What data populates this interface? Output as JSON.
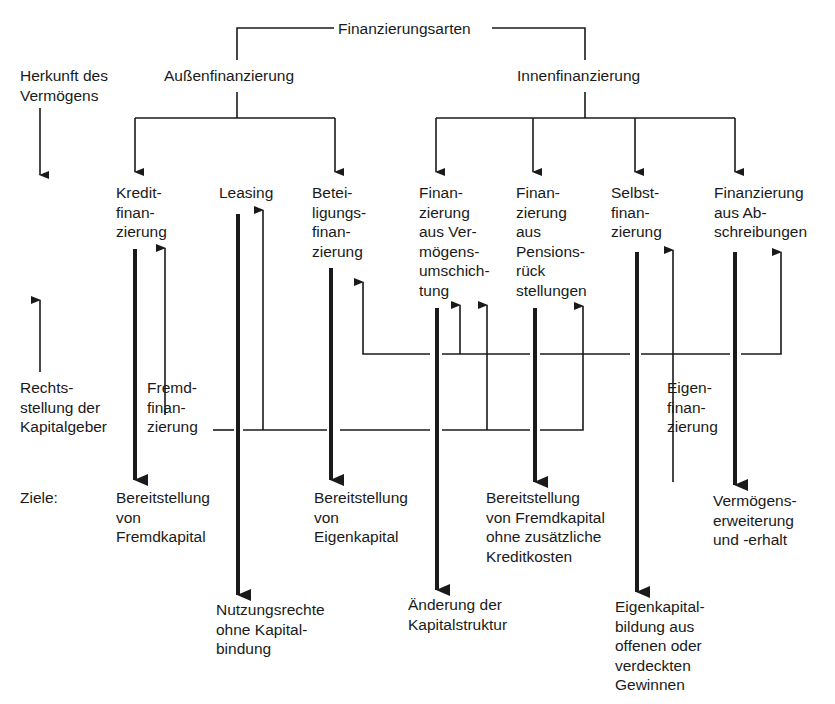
{
  "diagram": {
    "title": "Finanzierungsarten",
    "branches": {
      "aussen": "Außenfinanzierung",
      "innen": "Innenfinanzierung"
    },
    "row_labels": {
      "herkunft": "Herkunft des\nVermögens",
      "rechtsstellung": "Rechts-\nstellung der\nKapitalgeber",
      "ziele": "Ziele:"
    },
    "types": [
      {
        "id": "kredit",
        "label": "Kredit-\nfinan-\nzierung",
        "group": "Außenfinanzierung"
      },
      {
        "id": "leasing",
        "label": "Leasing",
        "group": "Außenfinanzierung"
      },
      {
        "id": "beteiligung",
        "label": "Betei-\nligungs-\nfinan-\nzierung",
        "group": "Außenfinanzierung"
      },
      {
        "id": "umschichtung",
        "label": "Finan-\nzierung\naus Ver-\nmögens-\numschich-\ntung",
        "group": "Innenfinanzierung"
      },
      {
        "id": "pension",
        "label": "Finan-\nzierung\naus\nPensions-\nrück\nstellungen",
        "group": "Innenfinanzierung"
      },
      {
        "id": "selbst",
        "label": "Selbst-\nfinan-\nzierung",
        "group": "Innenfinanzierung"
      },
      {
        "id": "abschreibung",
        "label": "Finanzierung\naus Ab-\nschreibungen",
        "group": "Innenfinanzierung"
      }
    ],
    "legal_status": {
      "fremd": "Fremd-\nfinan-\nzierung",
      "eigen": "Eigen-\nfinan-\nzierung"
    },
    "goals": [
      {
        "for": "kredit",
        "label": "Bereitstellung\nvon\nFremdkapital"
      },
      {
        "for": "leasing",
        "label": "Nutzungsrechte\nohne Kapital-\nbindung"
      },
      {
        "for": "beteiligung",
        "label": "Bereitstellung\nvon\nEigenkapital"
      },
      {
        "for": "umschichtung",
        "label": "Änderung der\nKapitalstruktur"
      },
      {
        "for": "pension",
        "label": "Bereitstellung\nvon Fremdkapital\nohne zusätzliche\nKreditkosten"
      },
      {
        "for": "selbst",
        "label": "Eigenkapital-\nbildung aus\noffenen oder\nverdeckten\nGewinnen"
      },
      {
        "for": "abschreibung",
        "label": "Vermögens-\nerweiterung\nund -erhalt"
      }
    ]
  }
}
